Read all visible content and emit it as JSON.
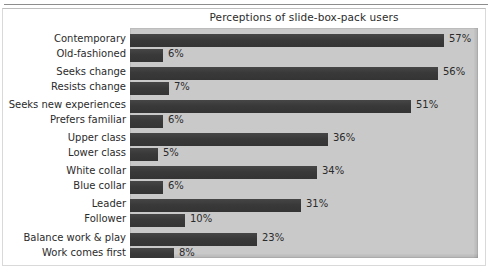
{
  "chart_data": {
    "type": "bar",
    "orientation": "horizontal",
    "title": "Perceptions of slide-box-pack users",
    "xlabel": "",
    "ylabel": "",
    "xlim": [
      0,
      63
    ],
    "grid": false,
    "legend": null,
    "value_suffix": "%",
    "bar_color": "#3b3b3b",
    "plot_background": "#c9c9c9",
    "page_background": "#ffffff",
    "categories": [
      "Contemporary",
      "Old-fashioned",
      "Seeks change",
      "Resists change",
      "Seeks new experiences",
      "Prefers familiar",
      "Upper class",
      "Lower class",
      "White collar",
      "Blue collar",
      "Leader",
      "Follower",
      "Balance work & play",
      "Work comes first"
    ],
    "values": [
      57,
      6,
      56,
      7,
      51,
      6,
      36,
      5,
      34,
      6,
      31,
      10,
      23,
      8
    ],
    "value_labels": [
      "57%",
      "6%",
      "56%",
      "7%",
      "51%",
      "6%",
      "36%",
      "5%",
      "34%",
      "6%",
      "31%",
      "10%",
      "23%",
      "8%"
    ],
    "groups": [
      {
        "name": "Contemporary vs Old-fashioned",
        "members": [
          "Contemporary",
          "Old-fashioned"
        ]
      },
      {
        "name": "Seeks change vs Resists change",
        "members": [
          "Seeks change",
          "Resists change"
        ]
      },
      {
        "name": "Seeks new experiences vs Prefers familiar",
        "members": [
          "Seeks new experiences",
          "Prefers familiar"
        ]
      },
      {
        "name": "Upper class vs Lower class",
        "members": [
          "Upper class",
          "Lower class"
        ]
      },
      {
        "name": "White collar vs Blue collar",
        "members": [
          "White collar",
          "Blue collar"
        ]
      },
      {
        "name": "Leader vs Follower",
        "members": [
          "Leader",
          "Follower"
        ]
      },
      {
        "name": "Balance work & play vs Work comes first",
        "members": [
          "Balance work & play",
          "Work comes first"
        ]
      }
    ]
  }
}
